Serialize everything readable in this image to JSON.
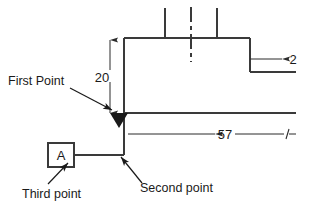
{
  "drawing": {
    "type": "engineering-dimension-sketch",
    "background_color": "#ffffff",
    "line_color": "#3a3a3a",
    "text_color": "#1a1a1a",
    "dimensions": [
      {
        "name": "vertical-height",
        "value": "20",
        "orientation": "vertical",
        "arrows": "both-ends"
      },
      {
        "name": "horizontal-length",
        "value": "57",
        "orientation": "horizontal",
        "arrows": "left-end"
      },
      {
        "name": "step-width",
        "value": "2",
        "orientation": "horizontal",
        "arrows": "left-end"
      }
    ],
    "datum": {
      "label": "A",
      "shape": "square-box"
    },
    "callouts": [
      {
        "name": "first-point",
        "label": "First Point"
      },
      {
        "name": "second-point",
        "label": "Second point"
      },
      {
        "name": "third-point",
        "label": "Third point"
      }
    ],
    "markers": [
      {
        "name": "datum-triangle",
        "shape": "filled-down-triangle"
      }
    ]
  },
  "labels": {
    "first_point": "First Point",
    "second_point": "Second point",
    "third_point": "Third point",
    "dim_20": "20",
    "dim_57": "57",
    "dim_2": "2",
    "datum_a": "A"
  }
}
